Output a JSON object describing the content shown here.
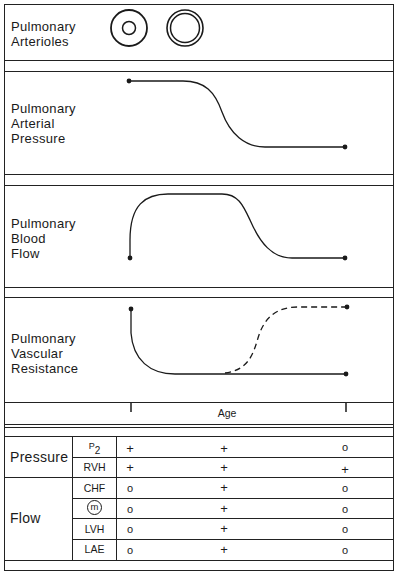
{
  "panels": {
    "arterioles": {
      "label_line1": "Pulmonary",
      "label_line2": "Arterioles",
      "icons": [
        "thick-walled-arteriole-icon",
        "thin-walled-arteriole-icon"
      ]
    },
    "arterial_pressure": {
      "label_line1": "Pulmonary",
      "label_line2": "Arterial",
      "label_line3": "Pressure",
      "curve": "high plateau then sigmoid decline to low plateau"
    },
    "blood_flow": {
      "label_line1": "Pulmonary",
      "label_line2": "Blood",
      "label_line3": "Flow",
      "curve": "rapid rise to high plateau, then sigmoid decline to low plateau"
    },
    "vascular_resistance": {
      "label_line1": "Pulmonary",
      "label_line2": "Vascular",
      "label_line3": "Resistance",
      "curve_solid": "high start, rapid fall to low plateau",
      "curve_dashed": "alternative path rising sigmoidally to high plateau"
    }
  },
  "axis": {
    "label": "Age"
  },
  "table": {
    "groups": [
      {
        "name": "Pressure",
        "rows": [
          {
            "sign": "P",
            "sign_sub": "2",
            "values": [
              "+",
              "+",
              "o"
            ]
          },
          {
            "sign": "RVH",
            "values": [
              "+",
              "+",
              "+"
            ]
          }
        ]
      },
      {
        "name": "Flow",
        "rows": [
          {
            "sign": "CHF",
            "values": [
              "o",
              "+",
              "o"
            ]
          },
          {
            "sign": "m",
            "circled": true,
            "values": [
              "o",
              "+",
              "o"
            ]
          },
          {
            "sign": "LVH",
            "values": [
              "o",
              "+",
              "o"
            ]
          },
          {
            "sign": "LAE",
            "values": [
              "o",
              "+",
              "o"
            ]
          }
        ]
      }
    ]
  }
}
